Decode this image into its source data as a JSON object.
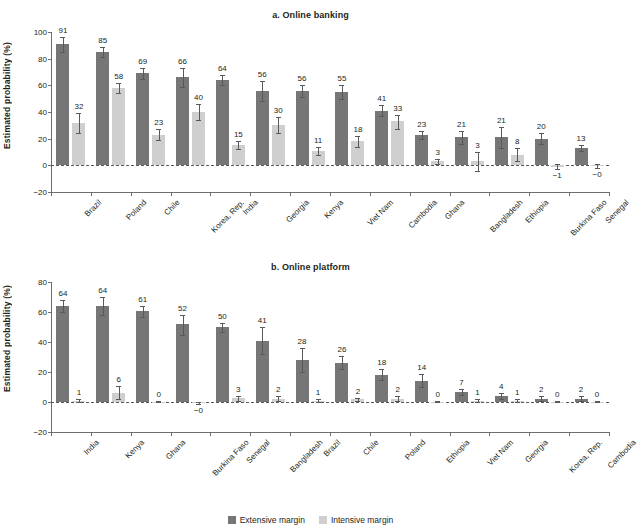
{
  "figure": {
    "ylabel": "Estimated probability (%)",
    "legend": [
      {
        "key": "extensive",
        "label": "Extensive margin",
        "color": "#767676"
      },
      {
        "key": "intensive",
        "label": "Intensive margin",
        "color": "#cfcfcf"
      }
    ]
  },
  "chart_data": [
    {
      "type": "bar",
      "id": "a",
      "title": "a. Online banking",
      "xlabel": "",
      "ylabel": "Estimated probability (%)",
      "ylim": [
        -20,
        100
      ],
      "yticks": [
        -20,
        0,
        20,
        40,
        60,
        80,
        100
      ],
      "ytick_labels": [
        "−20",
        "0",
        "20",
        "40",
        "60",
        "80",
        "100"
      ],
      "grid": false,
      "legend_position": "bottom-center",
      "categories": [
        "Brazil",
        "Poland",
        "Chile",
        "Korea, Rep.",
        "India",
        "Georgia",
        "Kenya",
        "Viet Nam",
        "Cambodia",
        "Ghana",
        "Bangladesh",
        "Ethiopia",
        "Burkina Faso",
        "Senegal"
      ],
      "series": [
        {
          "name": "Extensive margin",
          "color": "#767676",
          "values": [
            91,
            85,
            69,
            66,
            64,
            56,
            56,
            55,
            41,
            23,
            21,
            21,
            20,
            13
          ],
          "labels": [
            "91",
            "85",
            "69",
            "66",
            "64",
            "56",
            "56",
            "55",
            "41",
            "23",
            "21",
            "21",
            "20",
            "13"
          ],
          "err_low": [
            85,
            81,
            65,
            59,
            60,
            48,
            51,
            50,
            37,
            20,
            16,
            13,
            16,
            11
          ],
          "err_high": [
            96,
            89,
            73,
            73,
            68,
            63,
            60,
            60,
            45,
            26,
            26,
            29,
            24,
            15
          ]
        },
        {
          "name": "Intensive margin",
          "color": "#cfcfcf",
          "values": [
            32,
            58,
            23,
            40,
            15,
            30,
            11,
            18,
            33,
            3,
            3,
            8,
            -1,
            -0.3
          ],
          "labels": [
            "32",
            "58",
            "23",
            "40",
            "15",
            "30",
            "11",
            "18",
            "33",
            "3",
            "3",
            "8",
            "−1",
            "−0"
          ],
          "err_low": [
            24,
            54,
            19,
            34,
            12,
            24,
            8,
            14,
            27,
            1,
            -4,
            3,
            -3,
            -2
          ],
          "err_high": [
            39,
            62,
            27,
            46,
            18,
            36,
            14,
            22,
            38,
            5,
            10,
            13,
            1,
            1
          ]
        }
      ]
    },
    {
      "type": "bar",
      "id": "b",
      "title": "b. Online platform",
      "xlabel": "",
      "ylabel": "Estimated probability (%)",
      "ylim": [
        -20,
        80
      ],
      "yticks": [
        -20,
        0,
        20,
        40,
        60,
        80
      ],
      "ytick_labels": [
        "−20",
        "0",
        "20",
        "40",
        "60",
        "80"
      ],
      "grid": false,
      "legend_position": "bottom-center",
      "categories": [
        "India",
        "Kenya",
        "Ghana",
        "Burkina Faso",
        "Senegal",
        "Bangladesh",
        "Brazil",
        "Chile",
        "Poland",
        "Ethiopia",
        "Viet Nam",
        "Georgia",
        "Korea, Rep.",
        "Cambodia"
      ],
      "series": [
        {
          "name": "Extensive margin",
          "color": "#767676",
          "values": [
            64,
            64,
            61,
            52,
            50,
            41,
            28,
            26,
            18,
            14,
            7,
            4,
            2,
            2
          ],
          "labels": [
            "64",
            "64",
            "61",
            "52",
            "50",
            "41",
            "28",
            "26",
            "18",
            "14",
            "7",
            "4",
            "2",
            "2"
          ],
          "err_low": [
            60,
            58,
            57,
            45,
            47,
            32,
            20,
            22,
            15,
            10,
            5,
            2,
            1,
            1
          ],
          "err_high": [
            68,
            70,
            64,
            58,
            53,
            50,
            36,
            31,
            22,
            19,
            9,
            6,
            4,
            4
          ]
        },
        {
          "name": "Intensive margin",
          "color": "#cfcfcf",
          "values": [
            1,
            6,
            0.3,
            -0.3,
            3,
            2,
            1,
            2,
            2,
            0.3,
            1,
            1,
            0.3,
            0.3
          ],
          "labels": [
            "1",
            "6",
            "0",
            "−0",
            "3",
            "2",
            "1",
            "2",
            "2",
            "0",
            "1",
            "1",
            "0",
            "0"
          ],
          "err_low": [
            0,
            2,
            0,
            -1,
            1,
            1,
            0,
            1,
            1,
            0,
            0,
            0,
            0,
            0
          ],
          "err_high": [
            2,
            11,
            1,
            0,
            4,
            4,
            2,
            3,
            4,
            1,
            2,
            2,
            1,
            1
          ]
        }
      ]
    }
  ]
}
